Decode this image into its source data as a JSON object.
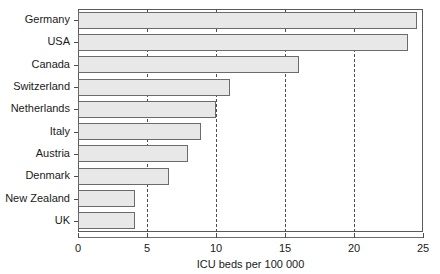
{
  "chart_data": {
    "type": "bar",
    "orientation": "horizontal",
    "title": "",
    "subtitle": "",
    "xlabel": "ICU beds per 100 000",
    "ylabel": "",
    "categories": [
      "Germany",
      "USA",
      "Canada",
      "Switzerland",
      "Netherlands",
      "Italy",
      "Austria",
      "Denmark",
      "New Zealand",
      "UK"
    ],
    "values": [
      24.6,
      23.9,
      16.0,
      11.0,
      10.0,
      8.9,
      8.0,
      6.6,
      4.1,
      4.1
    ],
    "xlim": [
      0,
      25
    ],
    "xticks": [
      0,
      5,
      10,
      15,
      20,
      25
    ],
    "xtick_labels": [
      "0",
      "5",
      "10",
      "15",
      "20",
      "25"
    ],
    "grid": "vertical-dashed",
    "legend": "none",
    "bar_fill_color": "#e8e8e8",
    "bar_edge_color": "#6b6b6b",
    "axis_color": "#5a5a5a",
    "grid_color": "#4d4d4d",
    "text_color": "#1a1a1a"
  }
}
